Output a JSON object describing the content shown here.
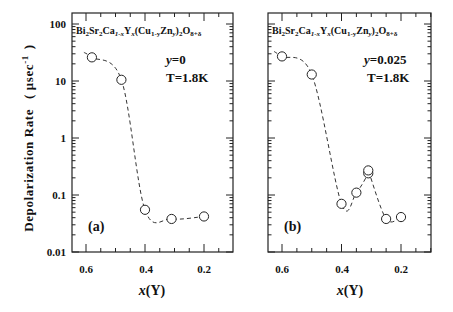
{
  "figure": {
    "ylabel": "Depolarization Rate ( μsec⁻¹ )",
    "ylabel_text": "Depolarization Rate",
    "ylabel_unit": "( μsec",
    "ylabel_exp": "-1",
    "ylabel_close": ")",
    "y_ticks": [
      "100",
      "10",
      "1",
      "0.1",
      "0.01"
    ],
    "x_ticks": [
      "0.6",
      "0.4",
      "0.2"
    ],
    "xlabel_var": "x",
    "xlabel_rest": "(Y)",
    "formula": "Bi2Sr2Ca1-xYx(Cu1-yZny)2O8+δ",
    "formula_parts": {
      "bi": "Bi",
      "s2a": "2",
      "sr": "Sr",
      "s2b": "2",
      "ca": "Ca",
      "sub1": "1-x",
      "y": "Y",
      "subx": "x",
      "cu": "(Cu",
      "sub2": "1-y",
      "zn": "Zn",
      "suby": "y",
      "paren": ")",
      "s2c": "2",
      "o": "O",
      "sub3": "8+δ"
    }
  },
  "panels": [
    {
      "tag": "(a)",
      "y_label": "y",
      "y_value": "=0",
      "temp": "T=1.8K"
    },
    {
      "tag": "(b)",
      "y_label": "y",
      "y_value": "=0.025",
      "temp": "T=1.8K"
    }
  ],
  "chart_data": [
    {
      "type": "scatter",
      "title": "(a) y=0, T=1.8K",
      "annotation": "Bi2Sr2Ca1-xYx(Cu1-yZny)2O8+δ",
      "xlabel": "x(Y)",
      "ylabel": "Depolarization Rate (μsec^-1)",
      "xlim": [
        0.65,
        0.1
      ],
      "ylim": [
        0.01,
        100
      ],
      "yscale": "log",
      "x_reversed": true,
      "grid": false,
      "series": [
        {
          "name": "y=0",
          "marker": "open-circle",
          "line": "dashed guide",
          "x": [
            0.58,
            0.48,
            0.4,
            0.31,
            0.2
          ],
          "y": [
            26,
            10.5,
            0.055,
            0.038,
            0.042
          ]
        }
      ]
    },
    {
      "type": "scatter",
      "title": "(b) y=0.025, T=1.8K",
      "annotation": "Bi2Sr2Ca1-xYx(Cu1-yZny)2O8+δ",
      "xlabel": "x(Y)",
      "ylabel": "Depolarization Rate (μsec^-1)",
      "xlim": [
        0.65,
        0.1
      ],
      "ylim": [
        0.01,
        100
      ],
      "yscale": "log",
      "x_reversed": true,
      "grid": false,
      "series": [
        {
          "name": "y=0.025",
          "marker": "open-circle",
          "line": "dashed guide",
          "x": [
            0.6,
            0.5,
            0.4,
            0.35,
            0.31,
            0.31,
            0.25,
            0.2
          ],
          "y": [
            27,
            13,
            0.07,
            0.11,
            0.24,
            0.27,
            0.038,
            0.041
          ]
        }
      ]
    }
  ]
}
